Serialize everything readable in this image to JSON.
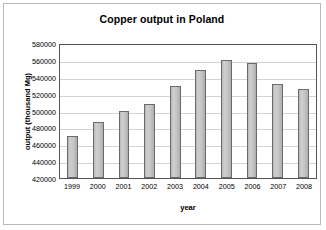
{
  "chart_data": {
    "type": "bar",
    "title": "Copper output in Poland",
    "xlabel": "year",
    "ylabel": "output (thousand Mg)",
    "categories": [
      "1999",
      "2000",
      "2001",
      "2002",
      "2003",
      "2004",
      "2005",
      "2006",
      "2007",
      "2008"
    ],
    "values": [
      470000,
      486000,
      499000,
      508000,
      529000,
      548000,
      560000,
      556000,
      532000,
      526000
    ],
    "ylim": [
      420000,
      580000
    ],
    "ytick_step": 20000,
    "yticks": [
      "580000",
      "560000",
      "540000",
      "520000",
      "500000",
      "480000",
      "460000",
      "440000",
      "420000"
    ],
    "ytick_values": [
      580000,
      560000,
      540000,
      520000,
      500000,
      480000,
      460000,
      440000,
      420000
    ],
    "grid": true,
    "legend": false,
    "bar_fill_color": "#c6c6c6",
    "bar_border_color": "#6a6a6a",
    "gridline_color": "#d4d4d4",
    "axis_color": "#555555"
  }
}
